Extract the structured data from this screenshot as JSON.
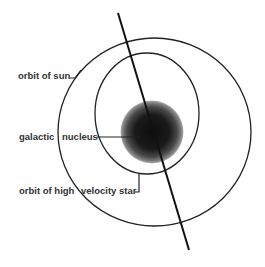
{
  "diagram": {
    "labels": {
      "orbit_of_sun": "orbit of sun",
      "galactic": "galactic",
      "nucleus": "nucleus",
      "orbit_of_high": "orbit of high",
      "velocity_star": "velocity star"
    },
    "colors": {
      "background": "#ffffff",
      "lines": "#222222",
      "nucleus_core": "#111111",
      "text": "#333333"
    },
    "elements": {
      "outer_orbit": "orbit of sun",
      "inner_orbit": "orbit of high velocity star",
      "center_mass": "galactic nucleus",
      "line": "galactic plane axis"
    }
  }
}
